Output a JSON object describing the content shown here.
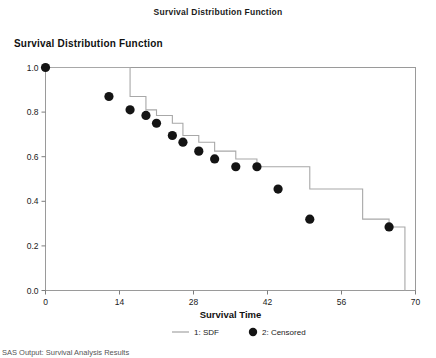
{
  "document": {
    "header_title": "Survival Distribution Function",
    "plot_title": "Survival Distribution Function",
    "footer_text": "SAS Output: Survival Analysis Results"
  },
  "chart_data": {
    "type": "line",
    "title": "Survival Distribution Function",
    "xlabel": "Survival Time",
    "ylabel": "",
    "xlim": [
      0,
      70
    ],
    "ylim": [
      0.0,
      1.0
    ],
    "xticks": [
      0,
      14,
      28,
      42,
      56,
      70
    ],
    "xtick_labels": [
      "0",
      "14",
      "28",
      "42",
      "56",
      "70"
    ],
    "yticks": [
      0.0,
      0.2,
      0.4,
      0.6,
      0.8,
      1.0
    ],
    "ytick_labels": [
      "0.0",
      "0.2",
      "0.4",
      "0.6",
      "0.8",
      "1.0"
    ],
    "grid": false,
    "legend_position": "bottom",
    "step_style": "post",
    "series": [
      {
        "name": "1: SDF",
        "type": "step",
        "color": "#a8a8a8",
        "x": [
          0,
          12,
          16,
          19,
          21,
          24,
          26,
          29,
          32,
          36,
          40,
          44,
          50,
          60,
          65,
          68,
          68
        ],
        "y": [
          1.0,
          1.0,
          0.87,
          0.81,
          0.785,
          0.75,
          0.695,
          0.665,
          0.625,
          0.59,
          0.555,
          0.555,
          0.455,
          0.32,
          0.285,
          0.285,
          0.0
        ]
      }
    ],
    "censored_points": {
      "name": "2: Censored",
      "marker": "filled-circle",
      "color": "#141414",
      "points": [
        {
          "x": 0,
          "y": 1.0
        },
        {
          "x": 12,
          "y": 0.87
        },
        {
          "x": 16,
          "y": 0.81
        },
        {
          "x": 19,
          "y": 0.785
        },
        {
          "x": 21,
          "y": 0.75
        },
        {
          "x": 24,
          "y": 0.695
        },
        {
          "x": 26,
          "y": 0.665
        },
        {
          "x": 29,
          "y": 0.625
        },
        {
          "x": 32,
          "y": 0.59
        },
        {
          "x": 36,
          "y": 0.555
        },
        {
          "x": 40,
          "y": 0.555
        },
        {
          "x": 44,
          "y": 0.455
        },
        {
          "x": 50,
          "y": 0.32
        },
        {
          "x": 65,
          "y": 0.285
        }
      ]
    },
    "legend": [
      {
        "label": "1: SDF",
        "marker": "line",
        "color": "#a8a8a8"
      },
      {
        "label": "2: Censored",
        "marker": "filled-circle",
        "color": "#141414"
      }
    ]
  }
}
